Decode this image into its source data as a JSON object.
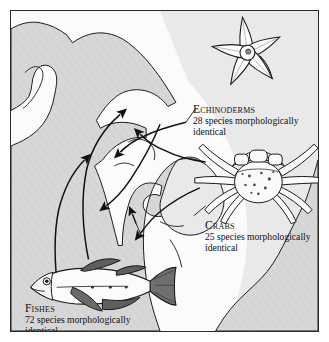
{
  "figure": {
    "kind": "scientific-illustration-map",
    "region_label": "Isthmus of Panama",
    "colors": {
      "land": "#d7d7d7",
      "ocean_pacific": "#fbfbfb",
      "ocean_caribbean": "#e3e3e3",
      "ink": "#1a1a1a",
      "frame": "#2b2b2b",
      "paper": "#ffffff"
    }
  },
  "isthmus": {
    "line1": "Isthmus of",
    "line2": "Panama"
  },
  "groups": [
    {
      "id": "echinoderms",
      "heading": "Echinoderms",
      "count": 28,
      "line1": "28 species morphologically",
      "line2": "identical",
      "icon": "starfish-icon"
    },
    {
      "id": "crabs",
      "heading": "Crabs",
      "count": 25,
      "line1": "25 species morphologically",
      "line2": "identical",
      "icon": "crab-icon"
    },
    {
      "id": "fishes",
      "heading": "Fishes",
      "count": 72,
      "line1": "72 species morphologically",
      "line2": "identical",
      "icon": "fish-icon"
    }
  ]
}
